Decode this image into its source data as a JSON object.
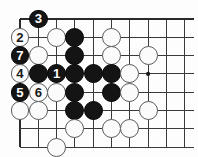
{
  "diagram": {
    "kind": "go-board-diagram",
    "type": "go-problem-sequence",
    "board": {
      "columns": 10,
      "rows": 8,
      "origin_x": 20,
      "origin_y": 19,
      "spacing": 18.3,
      "line_color": "#3a3a3a",
      "edge_line_color": "#2a2a2a",
      "background_color": "#fdfdfd",
      "edges": {
        "top": true,
        "left": true,
        "right": false,
        "bottom": false
      }
    },
    "star_points": [
      {
        "col": 8,
        "row": 4
      }
    ],
    "colors": {
      "black_stone": "#141414",
      "white_stone": "#fbfbfb",
      "white_stone_border": "#5d5d5d",
      "black_number_text": "#ffffff",
      "white_number_text": "#1a1a1a"
    },
    "stones": [
      {
        "col": 1,
        "row": 2,
        "color": "white",
        "label": "2"
      },
      {
        "col": 2,
        "row": 1,
        "color": "black",
        "label": "3"
      },
      {
        "col": 1,
        "row": 3,
        "color": "black",
        "label": "7"
      },
      {
        "col": 1,
        "row": 4,
        "color": "white",
        "label": "4"
      },
      {
        "col": 1,
        "row": 5,
        "color": "black",
        "label": "5"
      },
      {
        "col": 2,
        "row": 5,
        "color": "white",
        "label": "6"
      },
      {
        "col": 3,
        "row": 4,
        "color": "black",
        "label": "1"
      },
      {
        "col": 3,
        "row": 2,
        "color": "white",
        "label": ""
      },
      {
        "col": 4,
        "row": 2,
        "color": "black",
        "label": ""
      },
      {
        "col": 6,
        "row": 2,
        "color": "white",
        "label": ""
      },
      {
        "col": 2,
        "row": 3,
        "color": "white",
        "label": ""
      },
      {
        "col": 4,
        "row": 3,
        "color": "black",
        "label": ""
      },
      {
        "col": 6,
        "row": 3,
        "color": "white",
        "label": ""
      },
      {
        "col": 8,
        "row": 3,
        "color": "white",
        "label": ""
      },
      {
        "col": 2,
        "row": 4,
        "color": "black",
        "label": ""
      },
      {
        "col": 4,
        "row": 4,
        "color": "black",
        "label": ""
      },
      {
        "col": 5,
        "row": 4,
        "color": "black",
        "label": ""
      },
      {
        "col": 6,
        "row": 4,
        "color": "black",
        "label": ""
      },
      {
        "col": 7,
        "row": 4,
        "color": "white",
        "label": ""
      },
      {
        "col": 3,
        "row": 5,
        "color": "white",
        "label": ""
      },
      {
        "col": 4,
        "row": 5,
        "color": "black",
        "label": ""
      },
      {
        "col": 6,
        "row": 5,
        "color": "black",
        "label": ""
      },
      {
        "col": 7,
        "row": 5,
        "color": "white",
        "label": ""
      },
      {
        "col": 1,
        "row": 6,
        "color": "white",
        "label": ""
      },
      {
        "col": 2,
        "row": 6,
        "color": "white",
        "label": ""
      },
      {
        "col": 4,
        "row": 6,
        "color": "black",
        "label": ""
      },
      {
        "col": 5,
        "row": 6,
        "color": "black",
        "label": ""
      },
      {
        "col": 8,
        "row": 6,
        "color": "white",
        "label": ""
      },
      {
        "col": 4,
        "row": 7,
        "color": "white",
        "label": ""
      },
      {
        "col": 6,
        "row": 7,
        "color": "white",
        "label": ""
      },
      {
        "col": 7,
        "row": 7,
        "color": "white",
        "label": ""
      },
      {
        "col": 3,
        "row": 8,
        "color": "white",
        "label": ""
      }
    ]
  }
}
